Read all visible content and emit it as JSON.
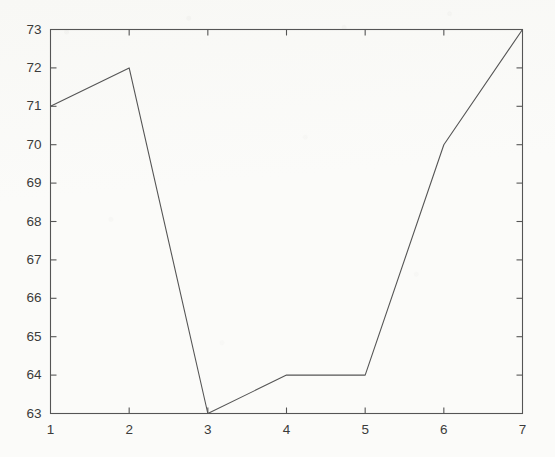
{
  "figure": {
    "background_color": "#fbfbf9",
    "axis_color": "#555555",
    "line_color": "#555555",
    "label_color": "#3b3b3b"
  },
  "chart_data": {
    "type": "line",
    "title": "",
    "subtitle": "",
    "xlabel": "",
    "ylabel": "",
    "x": [
      1,
      2,
      3,
      4,
      5,
      6,
      7
    ],
    "values": [
      71,
      72,
      63,
      64,
      64,
      70,
      73
    ],
    "series": [
      {
        "name": "series-1",
        "values": [
          71,
          72,
          63,
          64,
          64,
          70,
          73
        ],
        "color": "#555555",
        "marker": "none",
        "linewidth": 1
      }
    ],
    "xlim": [
      1,
      7
    ],
    "ylim": [
      63,
      73
    ],
    "xticks": [
      1,
      2,
      3,
      4,
      5,
      6,
      7
    ],
    "yticks": [
      63,
      64,
      65,
      66,
      67,
      68,
      69,
      70,
      71,
      72,
      73
    ],
    "xtick_labels": [
      "1",
      "2",
      "3",
      "4",
      "5",
      "6",
      "7"
    ],
    "ytick_labels": [
      "63",
      "64",
      "65",
      "66",
      "67",
      "68",
      "69",
      "70",
      "71",
      "72",
      "73"
    ],
    "grid": false,
    "legend": false,
    "legend_position": "none",
    "box_frame": true,
    "tick_direction": "in",
    "annotations": []
  }
}
